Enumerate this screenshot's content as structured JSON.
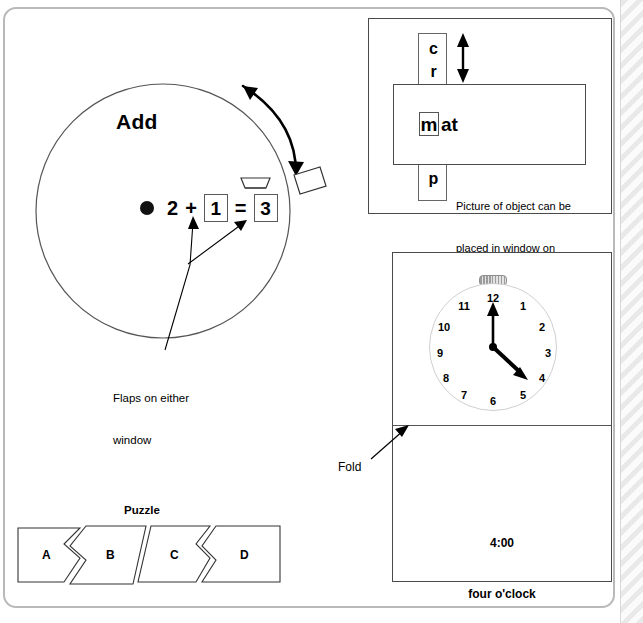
{
  "page": {
    "background_color": "#ffffff",
    "panel_border_color": "#b9b9b9",
    "ink_color": "#000000"
  },
  "add_wheel": {
    "title": "Add",
    "counter_icon": "filled-circle-counter",
    "equation": {
      "addend_1": "2",
      "operator": "+",
      "addend_2": "1",
      "equals": "=",
      "sum": "3",
      "windowed_values": [
        "1",
        "3"
      ]
    },
    "rotation_arrow": "double-headed-curved-arrow",
    "pull_tab": "rectangular-pull-tab",
    "annotation": "Flaps on either\nwindow",
    "annotation_line_1": "Flaps on either",
    "annotation_line_2": "window"
  },
  "puzzle": {
    "title": "Puzzle",
    "pieces": [
      {
        "label": "A"
      },
      {
        "label": "B"
      },
      {
        "label": "C"
      },
      {
        "label": "D"
      }
    ]
  },
  "word_card": {
    "strip_letters_top": [
      "c",
      "r"
    ],
    "strip_letters_bottom": [
      "f",
      "p"
    ],
    "slide_arrow": "up-down-double-arrow",
    "window_letter": "m",
    "word_ending": "at",
    "note": "Picture of object can be\nplaced in window on\nreverse side.",
    "note_line_1": "Picture of object can be",
    "note_line_2": "placed in window on",
    "note_line_3": "reverse side."
  },
  "clock_card": {
    "numerals": [
      "12",
      "1",
      "2",
      "3",
      "4",
      "5",
      "6",
      "7",
      "8",
      "9",
      "10",
      "11"
    ],
    "hour_hand_points_to": 4,
    "minute_hand_points_to": 12,
    "crown_icon": "clock-crown",
    "digital_time": "4:00",
    "spoken_time": "four o'clock",
    "fold_label": "Fold",
    "fold_arrow": "fold-pointer-arrow"
  }
}
